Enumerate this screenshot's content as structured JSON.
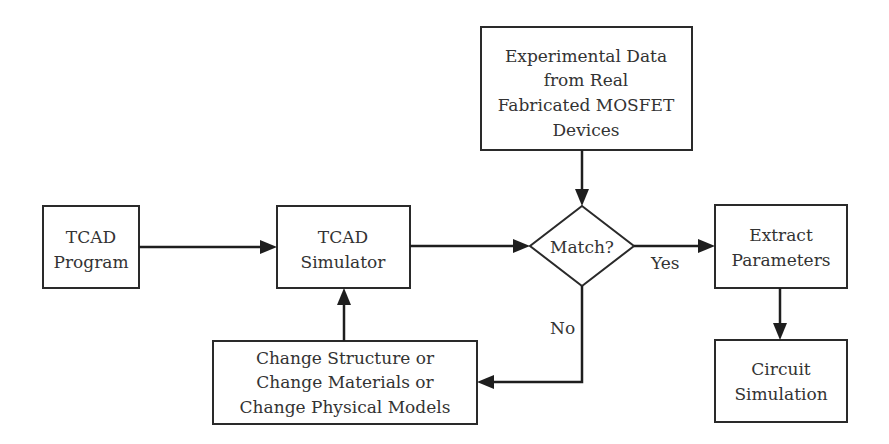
{
  "diagram": {
    "type": "flowchart",
    "nodes": {
      "experimental_data": {
        "shape": "rectangle",
        "lines": [
          "Experimental Data",
          "from Real",
          "Fabricated MOSFET",
          "Devices"
        ]
      },
      "tcad_program": {
        "shape": "rectangle",
        "lines": [
          "TCAD",
          "Program"
        ]
      },
      "tcad_simulator": {
        "shape": "rectangle",
        "lines": [
          "TCAD",
          "Simulator"
        ]
      },
      "match": {
        "shape": "diamond",
        "lines": [
          "Match?"
        ]
      },
      "extract_parameters": {
        "shape": "rectangle",
        "lines": [
          "Extract",
          "Parameters"
        ]
      },
      "change_box": {
        "shape": "rectangle",
        "lines": [
          "Change Structure or",
          "Change Materials or",
          "Change Physical Models"
        ]
      },
      "circuit_simulation": {
        "shape": "rectangle",
        "lines": [
          "Circuit",
          "Simulation"
        ]
      }
    },
    "edges": [
      {
        "from": "tcad_program",
        "to": "tcad_simulator",
        "label": ""
      },
      {
        "from": "tcad_simulator",
        "to": "match",
        "label": ""
      },
      {
        "from": "experimental_data",
        "to": "match",
        "label": ""
      },
      {
        "from": "match",
        "to": "extract_parameters",
        "label": "Yes"
      },
      {
        "from": "match",
        "to": "change_box",
        "label": "No"
      },
      {
        "from": "change_box",
        "to": "tcad_simulator",
        "label": ""
      },
      {
        "from": "extract_parameters",
        "to": "circuit_simulation",
        "label": ""
      }
    ],
    "edge_labels": {
      "yes": "Yes",
      "no": "No"
    }
  }
}
